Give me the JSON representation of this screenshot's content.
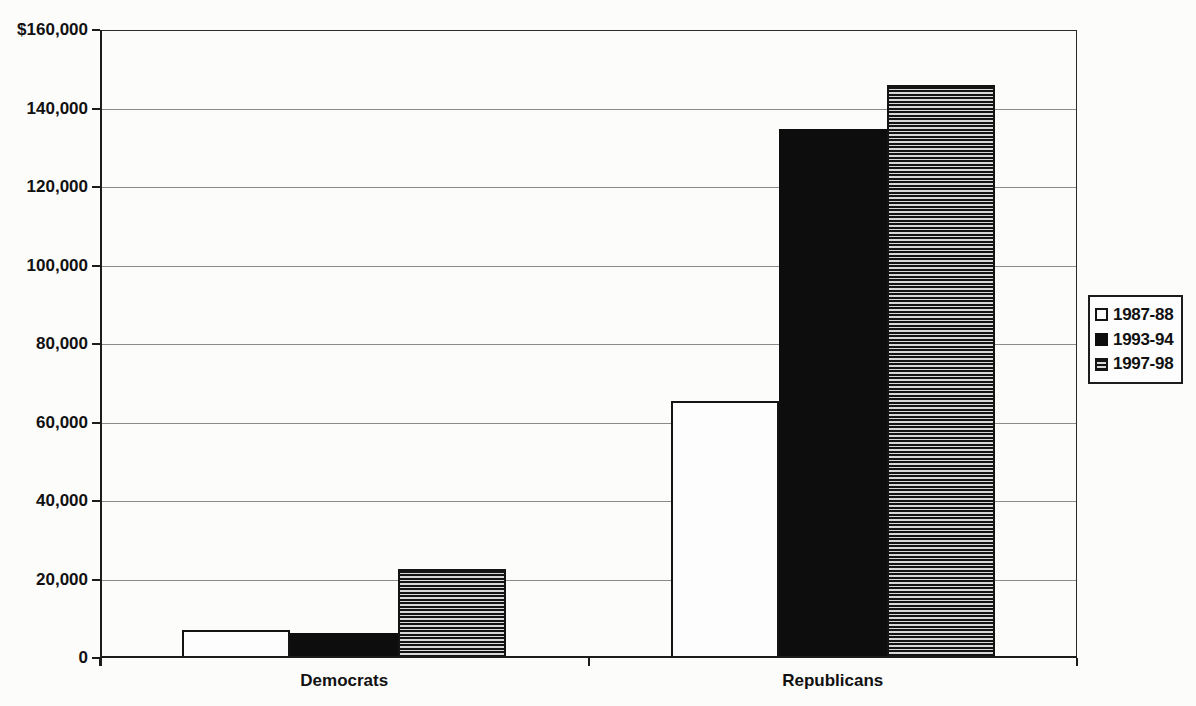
{
  "chart_data": {
    "type": "bar",
    "title": "",
    "categories": [
      "Democrats",
      "Republicans"
    ],
    "series": [
      {
        "name": "1987-88",
        "pattern": "white",
        "values": [
          7200,
          65500
        ]
      },
      {
        "name": "1993-94",
        "pattern": "black",
        "values": [
          6400,
          134800
        ]
      },
      {
        "name": "1997-98",
        "pattern": "hstripe",
        "values": [
          22700,
          146000
        ]
      }
    ],
    "xlabel": "",
    "ylabel": "",
    "ylim": [
      0,
      160000
    ],
    "ytick_step": 20000,
    "ytick_labels_top_to_bottom": [
      "$160,000",
      "140,000",
      "120,000",
      "100,000",
      "80,000",
      "60,000",
      "40,000",
      "20,000",
      "0"
    ],
    "grid": true,
    "legend_position": "right",
    "colors": {
      "bar_white_fill": "#fdfdfd",
      "bar_black_fill": "#0d0d0d",
      "stripe_dark": "#141414",
      "stripe_light": "#d8d8d8",
      "axis": "#1c1c1c",
      "gridline": "#8a8a8a",
      "text": "#111111",
      "background": "#fcfcfb"
    }
  }
}
